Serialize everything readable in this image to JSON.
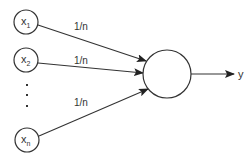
{
  "diagram": {
    "type": "neuron-averaging",
    "colors": {
      "stroke": "#333333",
      "text": "#333333",
      "background": "#ffffff"
    },
    "inputs": [
      {
        "id": "x1",
        "base": "x",
        "sub": "1",
        "cx": 26,
        "cy": 22
      },
      {
        "id": "x2",
        "base": "x",
        "sub": "2",
        "cx": 26,
        "cy": 60
      },
      {
        "id": "xn",
        "base": "x",
        "sub": "n",
        "cx": 27,
        "cy": 140
      }
    ],
    "ellipsis": "⋮",
    "edges": [
      {
        "from": "x1",
        "weight": "1/n",
        "label_x": 74,
        "label_y": 30
      },
      {
        "from": "x2",
        "weight": "1/n",
        "label_x": 74,
        "label_y": 64
      },
      {
        "from": "xn",
        "weight": "1/n",
        "label_x": 74,
        "label_y": 106
      }
    ],
    "node": {
      "cx": 167,
      "cy": 74,
      "r": 24
    },
    "output": {
      "label": "y"
    }
  }
}
